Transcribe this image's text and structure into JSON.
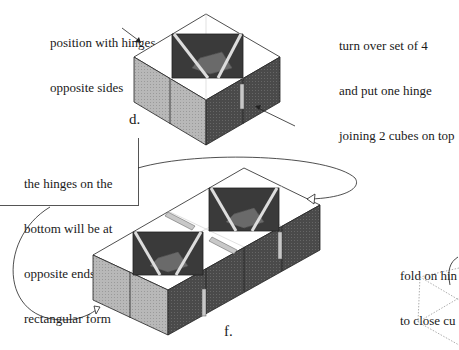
{
  "diagram": {
    "steps": [
      {
        "id": "d",
        "marker": "d.",
        "caption_lines": [
          "position with hinges on",
          "opposite sides"
        ],
        "description": "Four cubes arranged in a 2x2 block with hinges on opposite sides"
      },
      {
        "id": "e",
        "caption_lines": [
          "turn over set of 4",
          "and put one hinge",
          "joining 2 cubes on top"
        ]
      },
      {
        "id": "f",
        "marker": "f.",
        "caption_lines": [
          "the hinges on the",
          "bottom will be at",
          "opposite ends of the",
          "rectangular form"
        ],
        "description": "Two sets of four cubes joined into a rectangular form"
      },
      {
        "id": "g",
        "caption_lines": [
          "fold on hin",
          "to close cu"
        ],
        "description": "Partially visible dotted outline of folding cube (cropped)"
      }
    ]
  },
  "colors": {
    "face_light": "#b8b8b8",
    "face_dark": "#4a4a4a",
    "top_face": "#ffffff",
    "inner_dark": "#3a3a3a",
    "inner_mid": "#6a6a6a",
    "hinge": "#c8c8c8",
    "stroke": "#222222"
  }
}
